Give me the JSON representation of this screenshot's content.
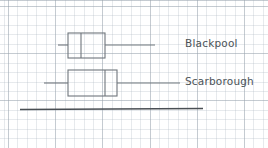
{
  "figure": {
    "title": "",
    "background": "#ffffff",
    "grid_color": "#aebbc6",
    "ink_color": "#6f767c",
    "axis_color": "#4a4f54"
  },
  "labels": {
    "blackpool": "Blackpool",
    "scarborough": "Scarborough"
  },
  "chart_data": {
    "type": "box",
    "title": "",
    "xlabel": "",
    "ylabel": "",
    "grid": true,
    "legend_position": "right-inline",
    "orientation": "horizontal",
    "axis": {
      "line_drawn": true,
      "x_start_px": 20,
      "x_end_px": 203,
      "y_px": 109,
      "ticks": [],
      "tick_labels": []
    },
    "categories": [
      "Blackpool",
      "Scarborough"
    ],
    "series": [
      {
        "name": "Blackpool",
        "min": 58,
        "q1": 68,
        "median": 81,
        "q3": 105,
        "max": 155,
        "row_center_px": 45,
        "box_top_px": 33,
        "box_bottom_px": 58
      },
      {
        "name": "Scarborough",
        "min": 44,
        "q1": 68,
        "median": 105,
        "q3": 117,
        "max": 180,
        "row_center_px": 83,
        "box_top_px": 70,
        "box_bottom_px": 96
      }
    ]
  }
}
